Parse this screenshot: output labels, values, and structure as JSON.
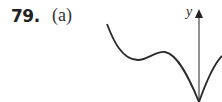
{
  "problem": {
    "number": "79.",
    "part": "(a)"
  },
  "graph": {
    "y_axis_label": "y",
    "curve_color": "#2a2a2a",
    "axis_color": "#555555"
  }
}
